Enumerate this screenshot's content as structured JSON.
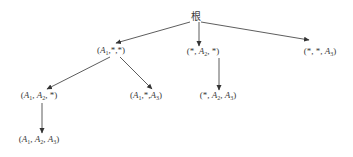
{
  "diagram": {
    "type": "tree",
    "stroke_color": "#333333",
    "text_color": "#3a3a3a",
    "nodes": [
      {
        "id": "root",
        "label": "根",
        "x": 196,
        "y": 17
      },
      {
        "id": "n_a1",
        "label": "(A1,*,*)",
        "x": 111,
        "y": 51
      },
      {
        "id": "n_a2",
        "label": "(*, A2, *)",
        "x": 203,
        "y": 52
      },
      {
        "id": "n_a3",
        "label": "(*, *, A3)",
        "x": 320,
        "y": 52
      },
      {
        "id": "n_a1a2",
        "label": "(A1, A2, *)",
        "x": 39,
        "y": 96
      },
      {
        "id": "n_a1a3",
        "label": "(A1,*,A3)",
        "x": 146,
        "y": 96
      },
      {
        "id": "n_a2a3",
        "label": "(*, A2, A3)",
        "x": 218,
        "y": 96
      },
      {
        "id": "n_a1a2a3",
        "label": "(A1, A2, A3)",
        "x": 39,
        "y": 140
      }
    ],
    "edges": [
      {
        "from": "root",
        "to": "n_a1",
        "x1": 190,
        "y1": 22,
        "x2": 116,
        "y2": 43
      },
      {
        "from": "root",
        "to": "n_a2",
        "x1": 199,
        "y1": 22,
        "x2": 199,
        "y2": 46
      },
      {
        "from": "root",
        "to": "n_a3",
        "x1": 201,
        "y1": 22,
        "x2": 309,
        "y2": 40
      },
      {
        "from": "n_a1",
        "to": "n_a1a2",
        "x1": 110,
        "y1": 57,
        "x2": 47,
        "y2": 89
      },
      {
        "from": "n_a1",
        "to": "n_a1a3",
        "x1": 120,
        "y1": 57,
        "x2": 152,
        "y2": 89
      },
      {
        "from": "n_a2",
        "to": "n_a2a3",
        "x1": 219,
        "y1": 58,
        "x2": 219,
        "y2": 90
      },
      {
        "from": "n_a1a2",
        "to": "n_a1a2a3",
        "x1": 42,
        "y1": 103,
        "x2": 42,
        "y2": 133
      }
    ]
  },
  "labels": {
    "root": "根",
    "n_a1": {
      "open": "(",
      "a": "A",
      "a_sub": "1",
      "rest": ",*,*)"
    },
    "n_a2": {
      "pre": "(*, ",
      "a": "A",
      "a_sub": "2",
      "rest": ", *)"
    },
    "n_a3": {
      "pre": "(*, *, ",
      "a": "A",
      "a_sub": "3",
      "rest": ")"
    },
    "n_a1a2": {
      "open": "(",
      "a": "A",
      "a_sub": "1",
      "mid": ", ",
      "b": "A",
      "b_sub": "2",
      "rest": ", *)"
    },
    "n_a1a3": {
      "open": "(",
      "a": "A",
      "a_sub": "1",
      "mid": ",*,",
      "b": "A",
      "b_sub": "3",
      "rest": ")"
    },
    "n_a2a3": {
      "pre": "(*, ",
      "a": "A",
      "a_sub": "2",
      "mid": ", ",
      "b": "A",
      "b_sub": "3",
      "rest": ")"
    },
    "n_a1a2a3": {
      "open": "(",
      "a": "A",
      "a_sub": "1",
      "mid": ", ",
      "b": "A",
      "b_sub": "2",
      "mid2": ", ",
      "c": "A",
      "c_sub": "3",
      "rest": ")"
    }
  }
}
